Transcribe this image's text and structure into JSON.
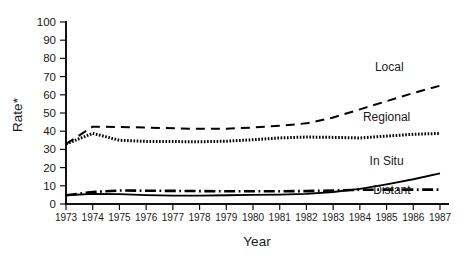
{
  "chart_data": {
    "type": "line",
    "title": "",
    "xlabel": "Year",
    "ylabel": "Rate*",
    "x": [
      1973,
      1974,
      1975,
      1976,
      1977,
      1978,
      1979,
      1980,
      1981,
      1982,
      1983,
      1984,
      1985,
      1986,
      1987
    ],
    "xtick_labels": [
      "1973",
      "1974",
      "1975",
      "1976",
      "1977",
      "1978",
      "1979",
      "1980",
      "1981",
      "1982",
      "1983",
      "1984",
      "1985",
      "1986",
      "1987"
    ],
    "ytick_labels": [
      "0",
      "10",
      "20",
      "30",
      "40",
      "50",
      "60",
      "70",
      "80",
      "90",
      "100"
    ],
    "ytick_values": [
      0,
      10,
      20,
      30,
      40,
      50,
      60,
      70,
      80,
      90,
      100
    ],
    "xlim": [
      1973,
      1987
    ],
    "ylim": [
      0,
      100
    ],
    "grid": false,
    "legend_position": "inline-right",
    "series": [
      {
        "name": "Local",
        "style": "dashed",
        "label_x": 1985.1,
        "label_y": 73,
        "values": [
          33.0,
          42.5,
          42.3,
          42.0,
          41.6,
          41.3,
          41.4,
          42.0,
          43.0,
          44.3,
          47.5,
          52.0,
          56.5,
          61.0,
          65.0
        ]
      },
      {
        "name": "Regional",
        "style": "dotted",
        "label_x": 1985.0,
        "label_y": 45.5,
        "values": [
          33.0,
          38.8,
          35.0,
          34.4,
          34.3,
          34.2,
          34.5,
          35.3,
          36.3,
          36.8,
          36.6,
          36.3,
          37.3,
          38.3,
          38.8
        ]
      },
      {
        "name": "In Situ",
        "style": "solid",
        "label_x": 1985.0,
        "label_y": 21.5,
        "values": [
          4.8,
          5.6,
          5.4,
          4.9,
          4.6,
          4.6,
          4.8,
          5.0,
          5.2,
          5.6,
          6.6,
          8.3,
          10.8,
          13.6,
          16.8
        ]
      },
      {
        "name": "Distant",
        "style": "dash-dot",
        "label_x": 1985.2,
        "label_y": 5.3,
        "values": [
          4.8,
          6.6,
          7.4,
          7.3,
          7.2,
          7.1,
          7.0,
          7.0,
          7.0,
          7.1,
          7.4,
          7.8,
          7.9,
          7.9,
          7.9
        ]
      }
    ],
    "colors": {
      "axis": "#111111",
      "line": "#000000",
      "background": "#ffffff"
    }
  }
}
